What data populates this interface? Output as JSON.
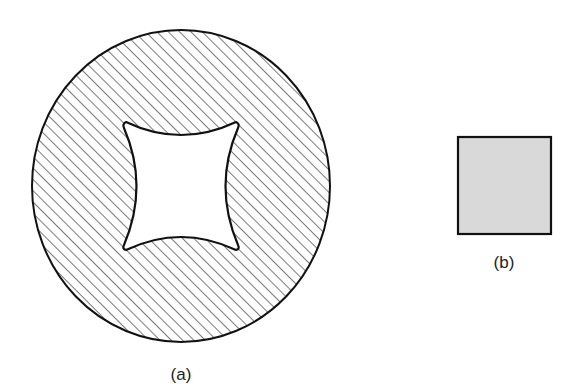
{
  "figure": {
    "panel_a": {
      "label": "(a)",
      "description": "Circular cross-section, diagonally hatched, with a concave four-pointed (astroid-like) hollow in the center"
    },
    "panel_b": {
      "label": "(b)",
      "description": "Solid square, light gray fill with dark outline"
    }
  },
  "colors": {
    "stroke": "#111111",
    "hatch": "#333333",
    "background": "#ffffff",
    "square_fill": "#d9d9d9"
  }
}
